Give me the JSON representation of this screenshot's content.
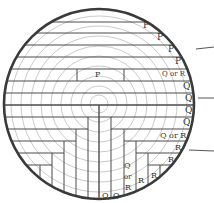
{
  "diagram": {
    "colors": {
      "outline": "#3a3a3a",
      "rings": "#b8b8b8",
      "boards": "#4a4a4a",
      "text": "#333333"
    },
    "log": {
      "cx": 99,
      "cy": 104,
      "r": 96
    },
    "rings": [
      9,
      18,
      28,
      38,
      48,
      58,
      68,
      78,
      88
    ],
    "labels": [
      {
        "text": "P",
        "x": 143,
        "y": 28,
        "size": 9
      },
      {
        "text": "P",
        "x": 157,
        "y": 40,
        "size": 9
      },
      {
        "text": "P",
        "x": 168,
        "y": 52,
        "size": 9
      },
      {
        "text": "P",
        "x": 175,
        "y": 64,
        "size": 9
      },
      {
        "text": "Q or R",
        "x": 162,
        "y": 76,
        "size": 7
      },
      {
        "text": "P",
        "x": 95,
        "y": 77,
        "size": 8
      },
      {
        "text": "Q",
        "x": 183,
        "y": 89,
        "size": 9
      },
      {
        "text": "Q",
        "x": 185,
        "y": 101,
        "size": 9
      },
      {
        "text": "Q",
        "x": 185,
        "y": 113,
        "size": 9
      },
      {
        "text": "Q",
        "x": 183,
        "y": 125,
        "size": 9
      },
      {
        "text": "Q or R",
        "x": 160,
        "y": 138,
        "size": 8
      },
      {
        "text": "R",
        "x": 175,
        "y": 150,
        "size": 8
      },
      {
        "text": "R",
        "x": 168,
        "y": 162,
        "size": 8
      },
      {
        "text": "Q",
        "x": 124,
        "y": 168,
        "size": 8
      },
      {
        "text": "or",
        "x": 124,
        "y": 179,
        "size": 7
      },
      {
        "text": "R",
        "x": 125,
        "y": 190,
        "size": 8
      },
      {
        "text": "R",
        "x": 138,
        "y": 183,
        "size": 8
      },
      {
        "text": "R",
        "x": 151,
        "y": 178,
        "size": 8
      },
      {
        "text": "Q",
        "x": 102,
        "y": 198,
        "size": 8
      },
      {
        "text": "Q",
        "x": 113,
        "y": 198,
        "size": 8
      }
    ],
    "leaders": [
      {
        "y1": 49,
        "y2": 47,
        "x1": 196,
        "x2": 214
      },
      {
        "y1": 98,
        "y2": 98,
        "x1": 198,
        "x2": 214
      },
      {
        "y1": 150,
        "y2": 151,
        "x1": 189,
        "x2": 214
      }
    ]
  }
}
